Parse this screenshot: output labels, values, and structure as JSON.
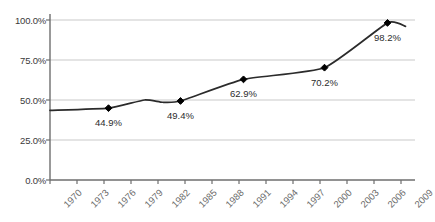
{
  "chart_data": {
    "type": "line",
    "title": "",
    "subtitle": "",
    "xlabel": "",
    "ylabel": "",
    "xlim": [
      1970,
      2010
    ],
    "ylim": [
      0,
      100
    ],
    "grid": true,
    "legend": "none",
    "series": [
      {
        "name": "",
        "x": [
          1970,
          1976.5,
          1980.5,
          1982.5,
          1984.5,
          1991.5,
          2000.5,
          2007.5,
          2009.5
        ],
        "values": [
          43.5,
          44.9,
          50.0,
          48.6,
          49.4,
          62.9,
          70.2,
          98.2,
          96.0
        ],
        "color": "#2b2b2b"
      }
    ],
    "labeled_points": [
      {
        "x": 1976.5,
        "value": 44.9,
        "label": "44.9%"
      },
      {
        "x": 1984.5,
        "value": 49.4,
        "label": "49.4%"
      },
      {
        "x": 1991.5,
        "value": 62.9,
        "label": "62.9%"
      },
      {
        "x": 2000.5,
        "value": 70.2,
        "label": "70.2%"
      },
      {
        "x": 2007.5,
        "value": 98.2,
        "label": "98.2%"
      }
    ],
    "y_ticks": [
      {
        "value": 100,
        "label": "100.0%"
      },
      {
        "value": 75,
        "label": "75.0%"
      },
      {
        "value": 50,
        "label": "50.0%"
      },
      {
        "value": 25,
        "label": "25.0%"
      },
      {
        "value": 0,
        "label": "0.0%"
      }
    ],
    "x_ticks": [
      {
        "value": 1970,
        "label": "1970"
      },
      {
        "value": 1973,
        "label": "1973"
      },
      {
        "value": 1976,
        "label": "1976"
      },
      {
        "value": 1979,
        "label": "1979"
      },
      {
        "value": 1982,
        "label": "1982"
      },
      {
        "value": 1985,
        "label": "1985"
      },
      {
        "value": 1988,
        "label": "1988"
      },
      {
        "value": 1991,
        "label": "1991"
      },
      {
        "value": 1994,
        "label": "1994"
      },
      {
        "value": 1997,
        "label": "1997"
      },
      {
        "value": 2000,
        "label": "2000"
      },
      {
        "value": 2003,
        "label": "2003"
      },
      {
        "value": 2006,
        "label": "2006"
      },
      {
        "value": 2009,
        "label": "2009"
      }
    ],
    "colors": {
      "line": "#2b2b2b",
      "marker": "#000000",
      "gridline": "#c9c9c9",
      "axis": "#6e6e6e",
      "ytick_text": "#3a3a3a",
      "xtick_text": "#6b6b6b",
      "point_label_text": "#2b2b2b",
      "background": "#ffffff"
    },
    "marker_style": "diamond"
  },
  "layout": {
    "plot_left": 50,
    "plot_right": 415,
    "plot_top": 20,
    "plot_bottom": 180,
    "tick_spacing": 27
  }
}
